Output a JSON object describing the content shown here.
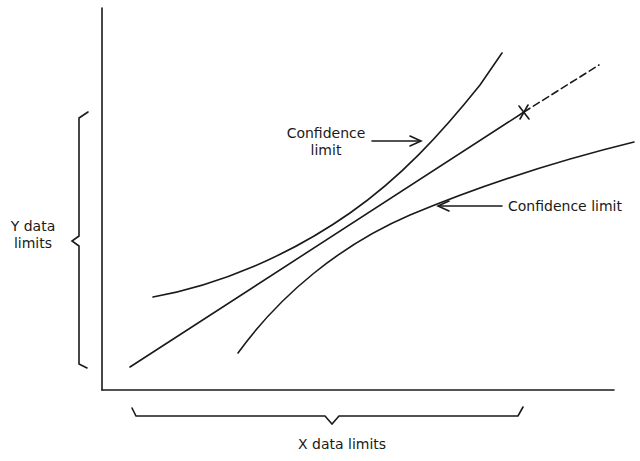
{
  "diagram": {
    "upper_curve_label_line1": "Confidence",
    "upper_curve_label_line2": "limit",
    "lower_curve_label": "Confidence limit",
    "y_brace_label_line1": "Y data",
    "y_brace_label_line2": "limits",
    "x_brace_label": "X data limits",
    "marker": "×",
    "line_color": "#1a1a1a",
    "background": "#ffffff"
  }
}
